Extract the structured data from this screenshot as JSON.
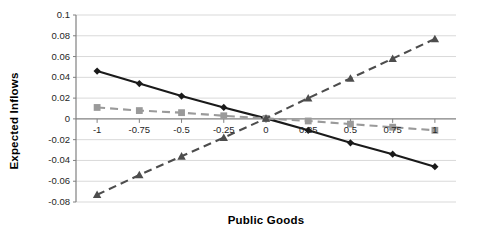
{
  "chart_data": {
    "type": "line",
    "title": "",
    "subtitle": "",
    "xlabel": "Public Goods",
    "ylabel": "Expected Inflows",
    "x": [
      -1,
      -0.75,
      -0.5,
      -0.25,
      0,
      0.25,
      0.5,
      0.75,
      1
    ],
    "xlim": [
      -1.125,
      1.125
    ],
    "ylim": [
      -0.08,
      0.1
    ],
    "xticks": [
      -1,
      -0.75,
      -0.5,
      -0.25,
      0,
      0.25,
      0.5,
      0.75,
      1
    ],
    "xtick_labels": [
      "-1",
      "-0.75",
      "-0.5",
      "-0.25",
      "0",
      "0.25",
      "0.5",
      "0.75",
      "1"
    ],
    "yticks": [
      0.1,
      0.08,
      0.06,
      0.04,
      0.02,
      0,
      -0.02,
      -0.04,
      -0.06,
      -0.08
    ],
    "ytick_labels": [
      "0.1",
      "0.08",
      "0.06",
      "0.04",
      "0.02",
      "0",
      "-0.02",
      "-0.04",
      "-0.06",
      "-0.08"
    ],
    "grid": true,
    "grid_axis": "y",
    "legend": false,
    "legend_position": "none",
    "series": [
      {
        "name": "series-1-diamond-solid",
        "marker": "diamond",
        "linestyle": "solid",
        "color": "#1a1a1a",
        "values": [
          0.046,
          0.034,
          0.022,
          0.011,
          0.0005,
          -0.011,
          -0.023,
          -0.034,
          -0.046
        ]
      },
      {
        "name": "series-2-square-dashed",
        "marker": "square",
        "linestyle": "dashed",
        "color": "#9a9a9a",
        "values": [
          0.011,
          0.008,
          0.006,
          0.003,
          0.0005,
          -0.002,
          -0.005,
          -0.008,
          -0.011
        ]
      },
      {
        "name": "series-3-triangle-dashed",
        "marker": "triangle",
        "linestyle": "dashed",
        "color": "#4d4d4d",
        "values": [
          -0.073,
          -0.054,
          -0.036,
          -0.018,
          0.0005,
          0.02,
          0.039,
          0.058,
          0.077
        ]
      }
    ]
  },
  "axes": {
    "x_title": "Public Goods",
    "y_title": "Expected Inflows"
  },
  "colors": {
    "grid": "#d9d9d9",
    "axis": "#808080",
    "zero_line": "#808080",
    "series_1": "#1a1a1a",
    "series_2": "#9a9a9a",
    "series_3": "#4d4d4d",
    "background": "#ffffff",
    "text": "#262626"
  }
}
